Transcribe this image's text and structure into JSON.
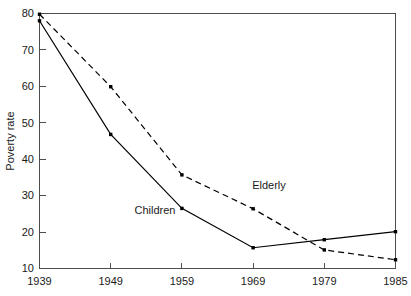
{
  "chart_data": {
    "type": "line",
    "title": "",
    "xlabel": "",
    "ylabel": "Poverty rate",
    "categories": [
      "1939",
      "1949",
      "1959",
      "1969",
      "1979",
      "1985"
    ],
    "x_tick_labels": [
      "1939",
      "1949",
      "1959",
      "1969",
      "1979",
      "1985"
    ],
    "y_tick_labels": [
      "10",
      "20",
      "30",
      "40",
      "50",
      "60",
      "70",
      "80"
    ],
    "y_ticks": [
      10,
      20,
      30,
      40,
      50,
      60,
      70,
      80
    ],
    "ylim": [
      10,
      80
    ],
    "xlim": [
      0,
      5
    ],
    "grid": false,
    "legend_position": "inline-annotations",
    "series": [
      {
        "name": "Children",
        "line_style": "solid",
        "marker": "square",
        "color": "#000000",
        "values": [
          78.0,
          46.8,
          26.5,
          15.7,
          17.9,
          20.1
        ]
      },
      {
        "name": "Elderly",
        "line_style": "dashed",
        "marker": "square",
        "color": "#000000",
        "values": [
          79.8,
          59.9,
          35.7,
          26.4,
          15.1,
          12.4
        ]
      }
    ],
    "annotations": [
      {
        "text": "Children",
        "series": "Children",
        "x_px": 155,
        "y_px": 214
      },
      {
        "text": "Elderly",
        "series": "Elderly",
        "x_px": 269,
        "y_px": 189
      }
    ]
  }
}
